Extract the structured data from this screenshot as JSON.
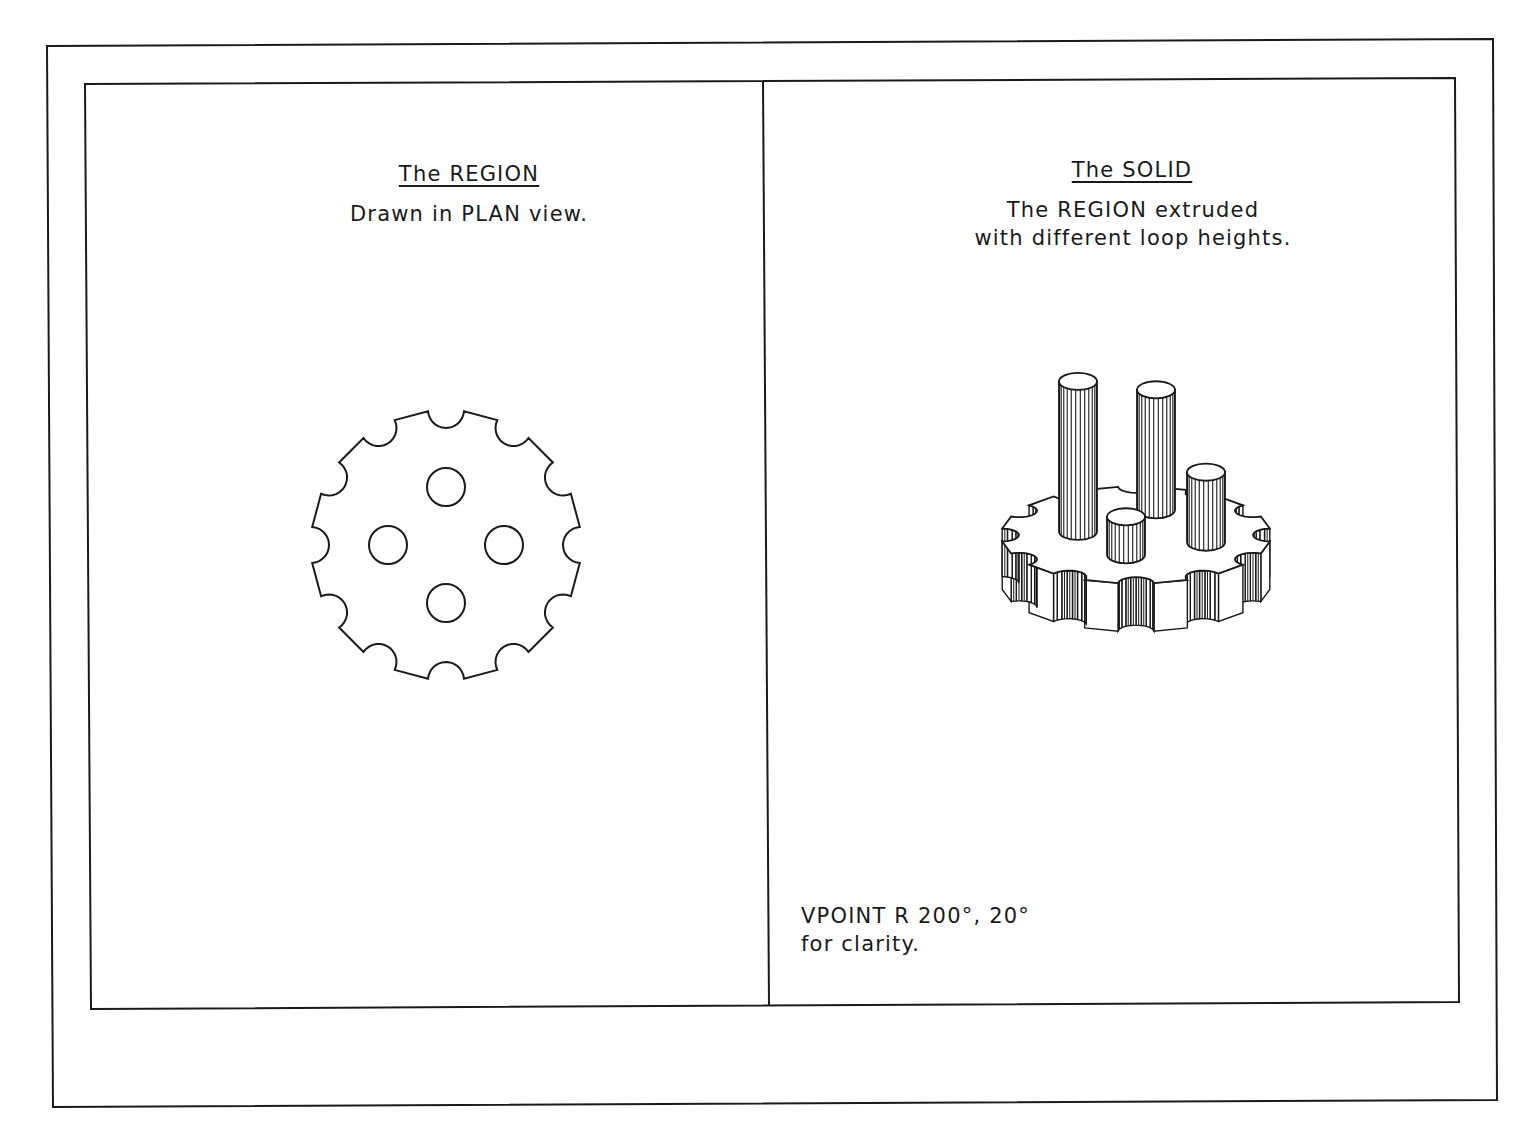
{
  "drawing": {
    "colors": {
      "background": "#ffffff",
      "line": "#1a1a1a"
    },
    "left_panel": {
      "title": "The REGION",
      "subtitle": "Drawn in PLAN view.",
      "figure": "plan-view-gear-region",
      "gear": {
        "center": [
          446,
          545
        ],
        "outer_radius": 135,
        "notch_count": 12,
        "notch_radius": 18,
        "hole_count": 4,
        "hole_radius": 19,
        "hole_offset": 58
      }
    },
    "right_panel": {
      "title": "The SOLID",
      "subtitle_line1": "The REGION extruded",
      "subtitle_line2": "with different loop heights.",
      "figure": "extruded-gear-solid-with-four-cylinders",
      "note_line1": "VPOINT R 200°, 20°",
      "note_line2": "for clarity."
    }
  }
}
